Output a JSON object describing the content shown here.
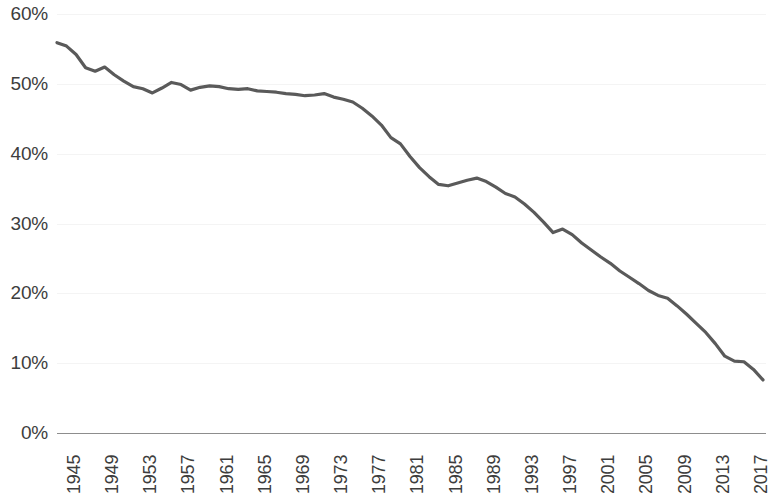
{
  "chart_data": {
    "type": "line",
    "title": "",
    "subtitle": "",
    "xlabel": "",
    "ylabel": "",
    "grid": true,
    "legend": false,
    "legend_position": "none",
    "line_color": "#5a5a5a",
    "text_color": "#3d3d3d",
    "gridline_color": "#f4f4f4",
    "axis_color": "#8d8d8d",
    "ylim": [
      0,
      60
    ],
    "ytick_labels": [
      "60%",
      "50%",
      "40%",
      "30%",
      "20%",
      "10%",
      "0%"
    ],
    "ytick_values": [
      60,
      50,
      40,
      30,
      20,
      10,
      0
    ],
    "xlim": [
      1945,
      2019
    ],
    "xtick_labels": [
      "1945",
      "1949",
      "1953",
      "1957",
      "1961",
      "1965",
      "1969",
      "1973",
      "1977",
      "1981",
      "1985",
      "1989",
      "1993",
      "1997",
      "2001",
      "2005",
      "2009",
      "2013",
      "2017"
    ],
    "xtick_values": [
      1945,
      1949,
      1953,
      1957,
      1961,
      1965,
      1969,
      1973,
      1977,
      1981,
      1985,
      1989,
      1993,
      1997,
      2001,
      2005,
      2009,
      2013,
      2017
    ],
    "x": [
      1945,
      1946,
      1947,
      1948,
      1949,
      1950,
      1951,
      1952,
      1953,
      1954,
      1955,
      1956,
      1957,
      1958,
      1959,
      1960,
      1961,
      1962,
      1963,
      1964,
      1965,
      1966,
      1967,
      1968,
      1969,
      1970,
      1971,
      1972,
      1973,
      1974,
      1975,
      1976,
      1977,
      1978,
      1979,
      1980,
      1981,
      1982,
      1983,
      1984,
      1985,
      1986,
      1987,
      1988,
      1989,
      1990,
      1991,
      1992,
      1993,
      1994,
      1995,
      1996,
      1997,
      1998,
      1999,
      2000,
      2001,
      2002,
      2003,
      2004,
      2005,
      2006,
      2007,
      2008,
      2009,
      2010,
      2011,
      2012,
      2013,
      2014,
      2015,
      2016,
      2017,
      2018,
      2019
    ],
    "values": [
      55.9,
      55.4,
      54.2,
      52.3,
      51.8,
      52.4,
      51.3,
      50.4,
      49.6,
      49.3,
      48.7,
      49.4,
      50.2,
      49.9,
      49.1,
      49.5,
      49.7,
      49.6,
      49.3,
      49.2,
      49.3,
      49.0,
      48.9,
      48.8,
      48.6,
      48.5,
      48.3,
      48.4,
      48.6,
      48.1,
      47.8,
      47.4,
      46.5,
      45.4,
      44.1,
      42.3,
      41.4,
      39.6,
      38.0,
      36.7,
      35.6,
      35.4,
      35.8,
      36.2,
      36.5,
      36.0,
      35.2,
      34.3,
      33.8,
      32.8,
      31.6,
      30.2,
      28.7,
      29.2,
      28.4,
      27.2,
      26.2,
      25.2,
      24.3,
      23.2,
      22.3,
      21.4,
      20.4,
      19.7,
      19.3,
      18.2,
      17.0,
      15.7,
      14.4,
      12.8,
      11.0,
      10.3,
      10.2,
      9.1,
      7.6
    ],
    "annotations": []
  }
}
